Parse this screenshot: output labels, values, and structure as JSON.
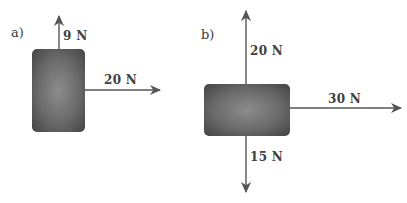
{
  "diagrams": [
    {
      "label": "a)",
      "box": {
        "shape": "tall-rectangle"
      },
      "forces": [
        {
          "label": "9 N",
          "direction": "up"
        },
        {
          "label": "20 N",
          "direction": "right"
        }
      ]
    },
    {
      "label": "b)",
      "box": {
        "shape": "wide-rectangle"
      },
      "forces": [
        {
          "label": "20 N",
          "direction": "up"
        },
        {
          "label": "30 N",
          "direction": "right"
        },
        {
          "label": "15 N",
          "direction": "down"
        }
      ]
    }
  ],
  "colors": {
    "box_center": "#8a8a8a",
    "box_edge": "#4a4a4a",
    "arrow": "#555555",
    "text": "#404040"
  }
}
